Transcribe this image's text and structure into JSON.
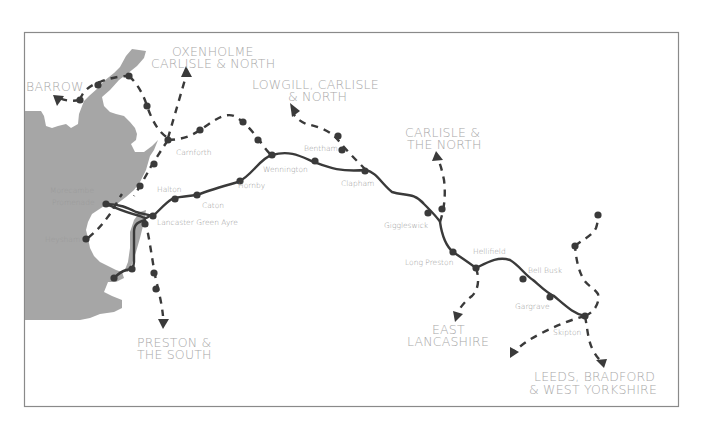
{
  "map": {
    "title": "Bentham Line route map",
    "colors": {
      "sea": "#a6a6a6",
      "rail": "#3a3a3a",
      "label": "#9a9a9a",
      "frame": "#8a8a8a"
    },
    "stations": [
      {
        "name": "Morecambe",
        "line2": "Promenade"
      },
      {
        "name": "Heysham"
      },
      {
        "name": "Lancaster Green Ayre"
      },
      {
        "name": "Halton"
      },
      {
        "name": "Caton"
      },
      {
        "name": "Hornby"
      },
      {
        "name": "Wennington"
      },
      {
        "name": "Bentham"
      },
      {
        "name": "Clapham"
      },
      {
        "name": "Giggleswick"
      },
      {
        "name": "Long Preston"
      },
      {
        "name": "Hellifield"
      },
      {
        "name": "Bell Busk"
      },
      {
        "name": "Gargrave"
      },
      {
        "name": "Skipton"
      },
      {
        "name": "Carnforth"
      }
    ],
    "destinations": [
      {
        "line1": "BARROW"
      },
      {
        "line1": "OXENHOLME",
        "line2": "CARLISLE & NORTH"
      },
      {
        "line1": "LOWGILL, CARLISLE",
        "line2": "& NORTH"
      },
      {
        "line1": "CARLISLE &",
        "line2": "THE NORTH"
      },
      {
        "line1": "PRESTON &",
        "line2": "THE SOUTH"
      },
      {
        "line1": "EAST",
        "line2": "LANCASHIRE"
      },
      {
        "line1": "LEEDS, BRADFORD",
        "line2": "& WEST YORKSHIRE"
      }
    ]
  }
}
